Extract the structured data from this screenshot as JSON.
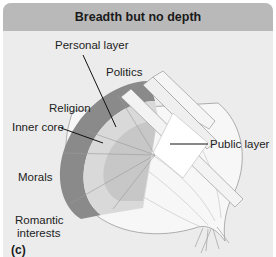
{
  "figure": {
    "title": "Breadth but no depth",
    "panel_label": "(c)",
    "labels": {
      "personal_layer": "Personal layer",
      "politics": "Politics",
      "religion": "Religion",
      "inner_core": "Inner core",
      "morals": "Morals",
      "romantic_interests_line1": "Romantic",
      "romantic_interests_line2": "interests",
      "public_layer": "Public layer"
    },
    "colors": {
      "header_bg": "#b9b9b9",
      "panel_bg": "#ececec",
      "outer_ring": "#8a8a8a",
      "inner_layers": "#d6d6d6",
      "onion_skin": "#f7f7f7"
    }
  }
}
